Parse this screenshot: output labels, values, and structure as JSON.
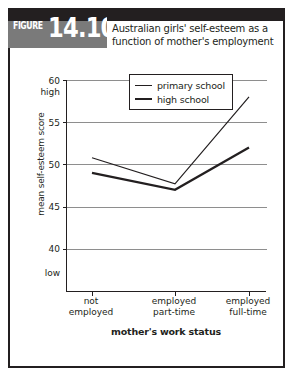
{
  "figure": {
    "label_word": "FIGURE",
    "label_number": "14.10",
    "title": "Australian girls' self-esteem as a function of mother's employment"
  },
  "chart_data": {
    "type": "line",
    "title": "Australian girls' self-esteem as a function of mother's employment",
    "xlabel": "mother's work status",
    "ylabel": "mean self-esteem score",
    "categories": [
      "not employed",
      "employed part-time",
      "employed full-time"
    ],
    "series": [
      {
        "name": "primary school",
        "values": [
          50.8,
          47.7,
          58.0
        ]
      },
      {
        "name": "high school",
        "values": [
          49.0,
          47.0,
          52.0
        ]
      }
    ],
    "ylim": [
      36,
      61
    ],
    "yticks": [
      40,
      45,
      50,
      55,
      60
    ],
    "ytick_labels": [
      "40",
      "45",
      "50",
      "55",
      "60"
    ],
    "y_low_label": "low",
    "y_high_label": "high",
    "grid": true,
    "legend_position": "top-left"
  }
}
